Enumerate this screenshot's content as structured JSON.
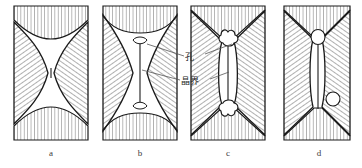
{
  "figure": {
    "panels": [
      {
        "id": "a",
        "caption": "a",
        "description": "two-particles-initial-contact-narrow-neck"
      },
      {
        "id": "b",
        "caption": "b",
        "description": "neck-growth-pore-shrinkage"
      },
      {
        "id": "c",
        "caption": "c",
        "description": "triangular-channel-pores-at-grain-boundary-junctions"
      },
      {
        "id": "d",
        "caption": "d",
        "description": "isolated-spherical-pores-closed-porosity"
      }
    ],
    "annotations": [
      {
        "id": "pore",
        "text": "孔"
      },
      {
        "id": "grain-boundary",
        "text": "晶界"
      }
    ],
    "colors": {
      "outline": "#1a1a1a",
      "hatch": "#6e6e6e",
      "leader": "#555555",
      "caption": "#3a3a3a",
      "background": "#ffffff"
    }
  }
}
